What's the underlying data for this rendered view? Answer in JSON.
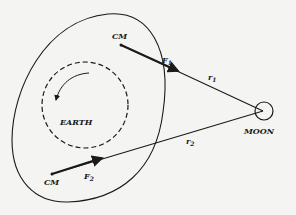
{
  "diagram": {
    "labels": {
      "cm_top": "CM",
      "cm_bottom": "CM",
      "earth": "EARTH",
      "moon": "MOON",
      "f1": "F",
      "f1_sub": "1",
      "f2": "F",
      "f2_sub": "2",
      "r1": "r",
      "r1_sub": "1",
      "r2": "r",
      "r2_sub": "2"
    },
    "elements": {
      "outer_boundary": "solid oval around Earth",
      "earth_circle": "dashed circle",
      "rotation_arrow": "counterclockwise curved arrow",
      "moon": "small circle at right"
    },
    "colors": {
      "background": "#f4f4f2",
      "ink": "#1a1a1a"
    }
  }
}
